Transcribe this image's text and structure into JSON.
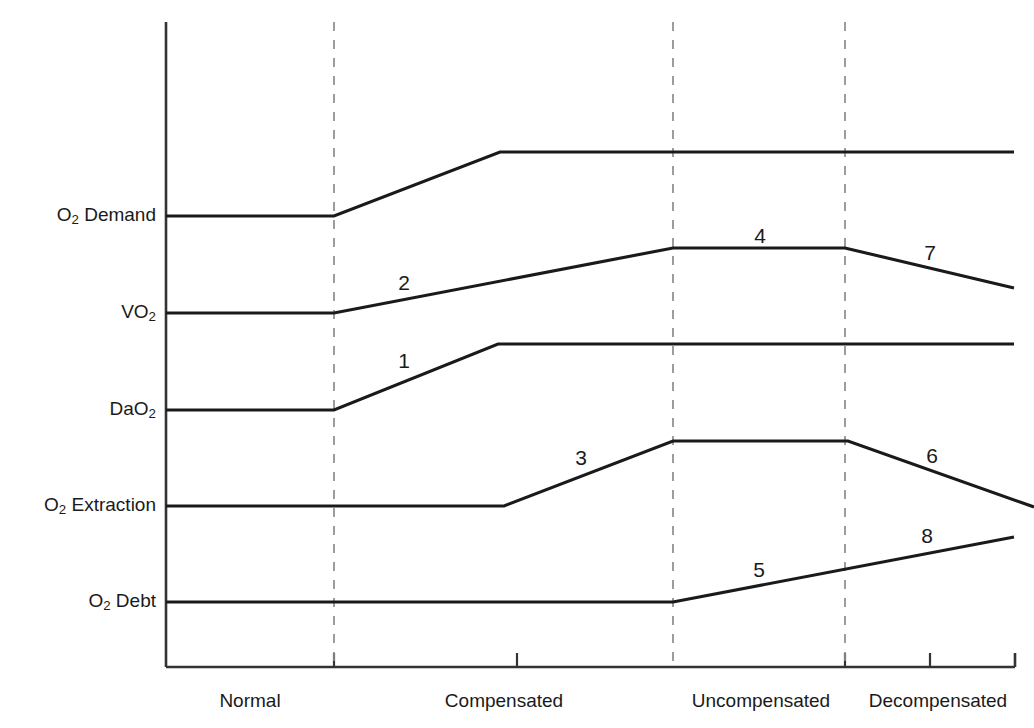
{
  "figure": {
    "title": "",
    "background_color": "#ffffff",
    "line_color": "#1a1a1a",
    "axis_color": "#333333",
    "divider_color": "#8c8c8c"
  },
  "axes": {
    "y_labels": [
      {
        "id": "o2-demand",
        "text_main": "O",
        "sub": "2",
        "text_tail": " Demand",
        "y": 216
      },
      {
        "id": "vo2",
        "text_main": "VO",
        "sub": "2",
        "text_tail": "",
        "y": 313
      },
      {
        "id": "dao2",
        "text_main": "DaO",
        "sub": "2",
        "text_tail": "",
        "y": 410
      },
      {
        "id": "o2-extraction",
        "text_main": "O",
        "sub": "2",
        "text_tail": " Extraction",
        "y": 506
      },
      {
        "id": "o2-debt",
        "text_main": "O",
        "sub": "2",
        "text_tail": " Debt",
        "y": 602
      }
    ],
    "x_labels": [
      {
        "id": "normal",
        "label": "Normal",
        "center": 250
      },
      {
        "id": "compensated",
        "label": "Compensated",
        "center": 504
      },
      {
        "id": "uncompensated",
        "label": "Uncompensated",
        "center": 761
      },
      {
        "id": "decompensated",
        "label": "Decompensated",
        "center": 938
      }
    ],
    "x_axis_y": 667,
    "y_axis_x": 166,
    "y_axis_top": 22,
    "x_axis_right": 1015,
    "tick_marks_x": [
      334,
      517,
      845,
      930
    ]
  },
  "dividers": [
    {
      "id": "divider-normal-compensated",
      "x": 334
    },
    {
      "id": "divider-compensated-uncompensated",
      "x": 673
    },
    {
      "id": "divider-uncompensated-decompensated",
      "x": 845
    }
  ],
  "chart_data": {
    "type": "line",
    "xlabel": "",
    "ylabel": "",
    "grid": false,
    "legend": "none",
    "x_categories": [
      "Normal",
      "Compensated",
      "Uncompensated",
      "Decompensated"
    ],
    "y_categories": [
      "O2 Demand",
      "VO2",
      "DaO2",
      "O2 Extraction",
      "O2 Debt"
    ],
    "series": [
      {
        "name": "O2 Demand",
        "points": [
          [
            166,
            216
          ],
          [
            334,
            216
          ],
          [
            500,
            152
          ],
          [
            1014,
            152
          ]
        ],
        "description": "Flat through Normal, rises during early Compensated, then plateaus high through Decompensated."
      },
      {
        "name": "VO2",
        "points": [
          [
            166,
            313
          ],
          [
            334,
            313
          ],
          [
            673,
            248
          ],
          [
            845,
            248
          ],
          [
            1014,
            288
          ]
        ],
        "description": "Flat through Normal, rises gradually through Compensated, plateaus in Uncompensated, falls in Decompensated."
      },
      {
        "name": "DaO2",
        "points": [
          [
            166,
            410
          ],
          [
            334,
            410
          ],
          [
            498,
            344
          ],
          [
            1014,
            344
          ]
        ],
        "description": "Flat through Normal, rises during early Compensated, then remains elevated and flat."
      },
      {
        "name": "O2 Extraction",
        "points": [
          [
            166,
            506
          ],
          [
            504,
            506
          ],
          [
            673,
            441
          ],
          [
            848,
            441
          ],
          [
            1034,
            507
          ]
        ],
        "description": "Flat until late Compensated, rises into Uncompensated, plateaus, then falls in Decompensated."
      },
      {
        "name": "O2 Debt",
        "points": [
          [
            166,
            602
          ],
          [
            673,
            602
          ],
          [
            1014,
            537
          ]
        ],
        "description": "Flat until end of Compensated, then rises steadily through Uncompensated and Decompensated."
      }
    ],
    "segment_numbers": [
      {
        "label": "1",
        "x": 404,
        "y": 360,
        "series": "DaO2",
        "stage": "Compensated"
      },
      {
        "label": "2",
        "x": 404,
        "y": 282,
        "series": "VO2",
        "stage": "Compensated"
      },
      {
        "label": "3",
        "x": 581,
        "y": 457,
        "series": "O2 Extraction",
        "stage": "Compensated"
      },
      {
        "label": "4",
        "x": 760,
        "y": 235,
        "series": "VO2",
        "stage": "Uncompensated"
      },
      {
        "label": "5",
        "x": 759,
        "y": 569,
        "series": "O2 Debt",
        "stage": "Uncompensated"
      },
      {
        "label": "6",
        "x": 932,
        "y": 455,
        "series": "O2 Extraction",
        "stage": "Decompensated"
      },
      {
        "label": "7",
        "x": 930,
        "y": 252,
        "series": "VO2",
        "stage": "Decompensated"
      },
      {
        "label": "8",
        "x": 927,
        "y": 535,
        "series": "O2 Debt",
        "stage": "Decompensated"
      }
    ]
  }
}
